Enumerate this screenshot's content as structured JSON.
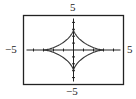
{
  "chart_data": {
    "type": "line",
    "title": "",
    "xlabel": "",
    "ylabel": "",
    "xlim": [
      -5,
      5
    ],
    "ylim": [
      -5,
      5
    ],
    "grid": false,
    "legend": null,
    "tick_labels": {
      "x_min": "−5",
      "x_max": "5",
      "y_min": "−5",
      "y_max": "5"
    },
    "x_ticks": [
      -4,
      -3,
      -2,
      -1,
      1,
      2,
      3,
      4
    ],
    "y_ticks": [
      -4,
      -3,
      -2,
      -1,
      1,
      2,
      3,
      4
    ],
    "series": [
      {
        "name": "astroid x=3cos³t, y=3sin³t",
        "parametric": true,
        "t_range": [
          0,
          6.2832
        ],
        "points": [
          [
            3,
            0
          ],
          [
            2.12,
            0.12
          ],
          [
            1.06,
            1.06
          ],
          [
            0.12,
            2.12
          ],
          [
            0,
            3
          ],
          [
            -0.12,
            2.12
          ],
          [
            -1.06,
            1.06
          ],
          [
            -2.12,
            0.12
          ],
          [
            -3,
            0
          ],
          [
            -2.12,
            -0.12
          ],
          [
            -1.06,
            -1.06
          ],
          [
            -0.12,
            -2.12
          ],
          [
            0,
            -3
          ],
          [
            0.12,
            -2.12
          ],
          [
            1.06,
            -1.06
          ],
          [
            2.12,
            -0.12
          ],
          [
            3,
            0
          ]
        ]
      }
    ]
  },
  "labels": {
    "top": "5",
    "bottom": "−5",
    "left": "−5",
    "right": "5"
  },
  "colors": {
    "frame": "#222222",
    "curve": "#333333",
    "axis": "#222222"
  }
}
